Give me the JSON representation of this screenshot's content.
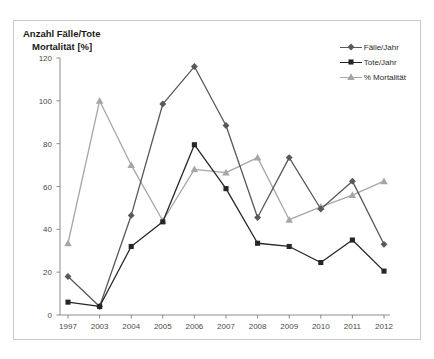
{
  "figure": {
    "title_line1": "Anzahl Fälle/Tote",
    "title_line2": "Mortalität [%]",
    "background": "#ffffff",
    "border_color": "#c9c9c9"
  },
  "legend": {
    "position": "top-right",
    "entries": [
      {
        "label": "Fälle/Jahr",
        "color": "#595959",
        "marker": "diamond"
      },
      {
        "label": "Tote/Jahr",
        "color": "#262626",
        "marker": "square"
      },
      {
        "label": "% Mortalität",
        "color": "#a6a6a6",
        "marker": "triangle"
      }
    ]
  },
  "axes": {
    "y_ticks": [
      "0",
      "20",
      "40",
      "60",
      "80",
      "100",
      "120"
    ],
    "x_ticks": [
      "1997",
      "2003",
      "2004",
      "2005",
      "2006",
      "2007",
      "2008",
      "2009",
      "2010",
      "2011",
      "2012"
    ],
    "axis_color": "#808080"
  },
  "chart_data": {
    "type": "line",
    "title": "Anzahl Fälle/Tote Mortalität [%]",
    "subtitle": "",
    "xlabel": "",
    "ylabel": "Anzahl Fälle/Tote Mortalität [%]",
    "categories": [
      "1997",
      "2003",
      "2004",
      "2005",
      "2006",
      "2007",
      "2008",
      "2009",
      "2010",
      "2011",
      "2012"
    ],
    "ylim": [
      0,
      120
    ],
    "ytick_values": [
      0,
      20,
      40,
      60,
      80,
      100,
      120
    ],
    "grid": false,
    "legend_position": "top-right",
    "series": [
      {
        "name": "Fälle/Jahr",
        "color": "#595959",
        "marker": "diamond",
        "values": [
          18,
          4,
          46.5,
          98.5,
          116,
          88.5,
          45.5,
          73.5,
          49.5,
          62.5,
          33
        ]
      },
      {
        "name": "Tote/Jahr",
        "color": "#262626",
        "marker": "square",
        "values": [
          6,
          4,
          32,
          43.5,
          79.5,
          59,
          33.5,
          32,
          24.5,
          35,
          20.5
        ]
      },
      {
        "name": "% Mortalität",
        "color": "#a6a6a6",
        "marker": "triangle",
        "values": [
          33.5,
          100,
          70,
          44,
          68,
          66.5,
          73.5,
          44.5,
          50.5,
          56,
          62.5
        ]
      }
    ]
  }
}
